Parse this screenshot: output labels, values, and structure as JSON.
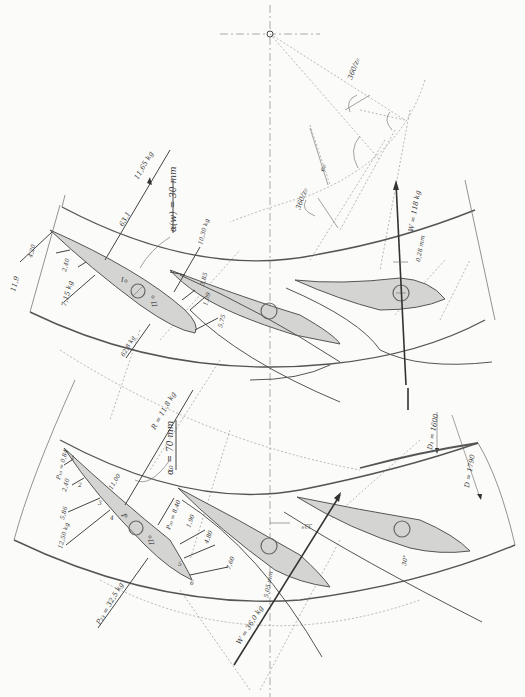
{
  "diagram": {
    "center_mark": "axis-center",
    "angle_labels": {
      "pitch_angle_top": "360/z₀",
      "pitch_angle_mid": "360/z₀",
      "eccentricity": "e₀"
    },
    "upper_cascade": {
      "roman_I": "I",
      "roman_II": "II",
      "forces": {
        "resultant": "11,65 kg",
        "r_value": "63,1",
        "alpha": "α(w) = 30 mm",
        "p1": "11,9",
        "p2": "4,20",
        "p3": "2,40",
        "p4": "7,15 kg",
        "lift": "62,8 kg",
        "p5": "10,30 kg",
        "p6": "3,85",
        "p7": "1,09",
        "p8": "5,75",
        "w_force": "W = 118 kg",
        "offset": "0,28 mm"
      }
    },
    "lower_cascade": {
      "roman_I": "I",
      "roman_II": "II",
      "forces": {
        "resultant": "R = 11,8 kg",
        "alpha": "α₀ = 70 mm",
        "p_top": "P₁₀ = 0,84",
        "p_a": "2,40",
        "p_b": "5,86",
        "p_c": "11,00",
        "p_d": "12,50 kg",
        "p_lift": "P₂₃ = 32,5 kg",
        "p_pressure": "P₂₀ = 8,40",
        "p_e": "1,90",
        "p_f": "4,80",
        "p_g": "7,60",
        "w_force": "W = 36,0 kg",
        "offset": "5,05 mm",
        "angle_1": "33°",
        "angle_2": "30°"
      },
      "station_numbers": [
        "1",
        "2",
        "3",
        "4",
        "5",
        "6"
      ]
    },
    "diameters": {
      "d1": "D₁ = 1600",
      "d": "D = 1790"
    }
  }
}
